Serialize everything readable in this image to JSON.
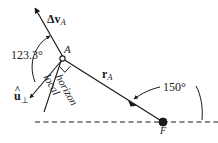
{
  "figure": {
    "kind": "orbital-mechanics-vector-diagram",
    "width": 218,
    "height": 143,
    "background_color": "#ffffff",
    "stroke_color": "#1a1a1a"
  },
  "labels": {
    "delta_v": {
      "symbol": "Δv",
      "subscript": "A",
      "text": "Δv_A"
    },
    "flight_path_angle": {
      "value": "123.3",
      "unit": "°",
      "text": "123.3°"
    },
    "point_a": {
      "text": "A"
    },
    "u_perp": {
      "symbol": "u",
      "hat": "^",
      "subscript": "⊥",
      "text": "û⊥"
    },
    "radius_vector": {
      "symbol": "r",
      "subscript": "A",
      "text": "r_A"
    },
    "true_anomaly": {
      "value": "150",
      "unit": "°",
      "text": "150°"
    },
    "point_f": {
      "text": "F"
    },
    "local_horizon": {
      "line1": "local",
      "line2": "horizon",
      "text": "local horizon"
    }
  },
  "geometry": {
    "point_a": {
      "x": 62,
      "y": 58,
      "marker": "open-circle"
    },
    "point_f": {
      "x": 163,
      "y": 122,
      "marker": "filled-circle"
    },
    "delta_v_arrow": {
      "from": {
        "x": 62,
        "y": 58
      },
      "to": {
        "x": 33,
        "y": 5
      }
    },
    "u_perp_arrow": {
      "from": {
        "x": 62,
        "y": 58
      },
      "to": {
        "x": 27,
        "y": 100
      }
    },
    "r_a_arrow": {
      "from": {
        "x": 163,
        "y": 122
      },
      "to": {
        "x": 62,
        "y": 58
      }
    },
    "horizon_dashed_line": {
      "x1": 35,
      "y1": 122,
      "x2": 218,
      "y2": 122
    },
    "right_angle_marker": {
      "x": 67,
      "y": 64
    },
    "arc_123_3": {
      "label": "123.3°"
    },
    "arc_150": {
      "label": "150°"
    }
  }
}
